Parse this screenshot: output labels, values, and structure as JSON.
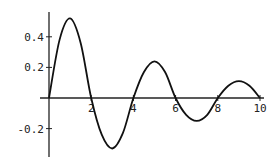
{
  "chart_data": {
    "type": "line",
    "title": "",
    "xlabel": "",
    "ylabel": "",
    "xlim": [
      0,
      10
    ],
    "ylim": [
      -0.33,
      0.53
    ],
    "grid": false,
    "legend": null,
    "x_ticks": [
      2,
      4,
      6,
      8,
      10
    ],
    "x_tick_labels": [
      "2",
      "4",
      "6",
      "8",
      "10"
    ],
    "y_ticks": [
      0.4,
      0.2,
      -0.2
    ],
    "y_tick_labels": [
      "0.4",
      "0.2",
      "-0.2"
    ],
    "series": [
      {
        "name": "damped oscillation",
        "x": [
          0,
          0.5,
          1,
          1.5,
          2,
          2.5,
          3,
          3.5,
          4,
          4.5,
          5,
          5.5,
          6,
          6.5,
          7,
          7.5,
          8,
          8.5,
          9,
          9.5,
          10
        ],
        "values": [
          0,
          0.38,
          0.52,
          0.36,
          0,
          -0.24,
          -0.33,
          -0.23,
          0,
          0.17,
          0.24,
          0.17,
          0,
          -0.11,
          -0.15,
          -0.11,
          0,
          0.08,
          0.11,
          0.08,
          0
        ]
      }
    ],
    "line_color": "#111111"
  }
}
